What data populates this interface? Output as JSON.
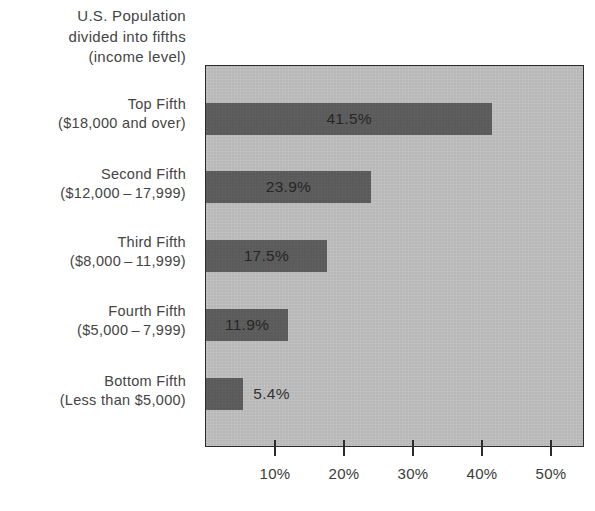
{
  "header": {
    "lines": [
      "U.S. Population",
      "divided into fifths",
      "(income level)"
    ]
  },
  "colors": {
    "bar": "#5b5b5b",
    "plot_background": "#bcbcbc",
    "border": "#2b2b2b",
    "text": "#3a3a3a"
  },
  "chart_data": {
    "type": "bar",
    "orientation": "horizontal",
    "title": "U.S. Population divided into fifths (income level)",
    "xlabel": "",
    "ylabel": "U.S. Population divided into fifths (income level)",
    "categories": [
      "Top Fifth ($18,000 and over)",
      "Second Fifth ($12,000-17,999)",
      "Third Fifth ($8,000-11,999)",
      "Fourth Fifth ($5,000-7,999)",
      "Bottom Fifth (Less than $5,000)"
    ],
    "category_lines": [
      [
        "Top Fifth",
        "($18,000 and over)"
      ],
      [
        "Second Fifth",
        "($12,000 – 17,999)"
      ],
      [
        "Third Fifth",
        "($8,000 – 11,999)"
      ],
      [
        "Fourth Fifth",
        "($5,000 – 7,999)"
      ],
      [
        "Bottom Fifth",
        "(Less than $5,000)"
      ]
    ],
    "values": [
      41.5,
      23.9,
      17.5,
      11.9,
      5.4
    ],
    "value_labels": [
      "41.5%",
      "23.9%",
      "17.5%",
      "11.9%",
      "5.4%"
    ],
    "xticks": [
      10,
      20,
      30,
      40,
      50
    ],
    "xtick_labels": [
      "10%",
      "20%",
      "30%",
      "40%",
      "50%"
    ],
    "xlim": [
      0,
      54
    ],
    "grid": false,
    "legend": null
  }
}
